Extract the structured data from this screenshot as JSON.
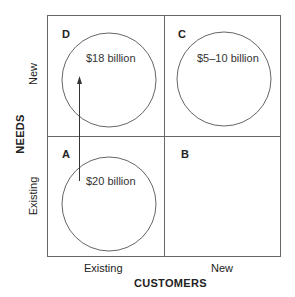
{
  "diagram": {
    "type": "2x2-matrix",
    "x_axis": {
      "title": "CUSTOMERS",
      "ticks": [
        "Existing",
        "New"
      ]
    },
    "y_axis": {
      "title": "NEEDS",
      "ticks": [
        "Existing",
        "New"
      ]
    },
    "quadrants": [
      {
        "letter": "D",
        "position": "top-left",
        "value": "$18 billion",
        "has_circle": true
      },
      {
        "letter": "C",
        "position": "top-right",
        "value": "$5–10 billion",
        "has_circle": true
      },
      {
        "letter": "A",
        "position": "bottom-left",
        "value": "$20 billion",
        "has_circle": true
      },
      {
        "letter": "B",
        "position": "bottom-right",
        "value": "",
        "has_circle": false
      }
    ],
    "arrow": {
      "from": "A",
      "to": "D",
      "direction": "up"
    },
    "colors": {
      "line": "#555555",
      "circle": "#555555",
      "text": "#222222"
    }
  }
}
